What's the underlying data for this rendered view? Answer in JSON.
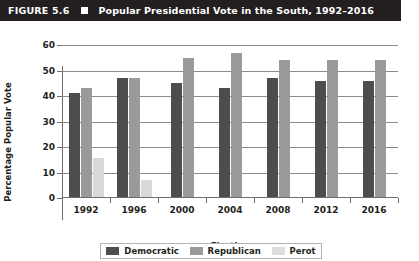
{
  "header": {
    "figure_number": "FIGURE 5.6",
    "marker_icon": "filled-square-icon",
    "title": "Popular Presidential Vote in the South, 1992–2016"
  },
  "chart_data": {
    "type": "bar",
    "title": "Popular Presidential Vote in the South, 1992–2016",
    "xlabel": "Election",
    "ylabel": "Percentage Popular Vote",
    "categories": [
      "1992",
      "1996",
      "2000",
      "2004",
      "2008",
      "2012",
      "2016"
    ],
    "series": [
      {
        "name": "Democratic",
        "color": "#4d4d4d",
        "values": [
          41,
          47,
          45,
          43,
          47,
          46,
          46
        ]
      },
      {
        "name": "Republican",
        "color": "#9a9a9a",
        "values": [
          43,
          47,
          55,
          57,
          54,
          54,
          54
        ]
      },
      {
        "name": "Perot",
        "color": "#d9d9d9",
        "values": [
          15.5,
          7,
          null,
          null,
          null,
          null,
          null
        ]
      }
    ],
    "ylim": [
      0,
      60
    ],
    "yticks": [
      0,
      10,
      20,
      30,
      40,
      50,
      60
    ],
    "ytick_labels": [
      "0",
      "10",
      "20",
      "30",
      "40",
      "50",
      "60"
    ],
    "grid": true,
    "grid_axis": "y",
    "legend_position": "bottom"
  },
  "legend": {
    "items": [
      {
        "label": "Democratic",
        "swatch": "democratic-swatch"
      },
      {
        "label": "Republican",
        "swatch": "republican-swatch"
      },
      {
        "label": "Perot",
        "swatch": "perot-swatch"
      }
    ]
  }
}
